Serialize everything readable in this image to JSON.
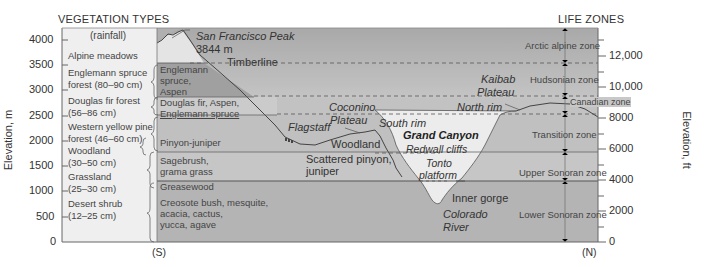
{
  "headers": {
    "left": "VEGETATION TYPES",
    "rainfall": "(rainfall)",
    "right": "LIFE ZONES"
  },
  "axes": {
    "left_label": "Elevation, m",
    "right_label": "Elevation, ft",
    "left_ticks": [
      "4000",
      "3500",
      "3000",
      "2500",
      "2000",
      "1500",
      "1000",
      "500",
      "0"
    ],
    "right_ticks": [
      "12,000",
      "10,000",
      "8000",
      "6000",
      "4000",
      "2000",
      "0"
    ],
    "south": "(S)",
    "north": "(N)"
  },
  "vegetation_types": [
    {
      "name": "Alpine meadows"
    },
    {
      "name": "Englemann spruce",
      "rain": "forest (80–90 cm)"
    },
    {
      "name": "Douglas fir forest",
      "rain": "(56–86 cm)"
    },
    {
      "name": "Western yellow pine",
      "rain": "forest (46–60 cm)"
    },
    {
      "name": "Woodland",
      "rain": "(30–50 cm)"
    },
    {
      "name": "Grassland",
      "rain": "(25–30 cm)"
    },
    {
      "name": "Desert shrub",
      "rain": "(12–25 cm)"
    }
  ],
  "band_labels": {
    "englemann": [
      "Englemann",
      "spruce,",
      "Aspen"
    ],
    "douglas": [
      "Douglas fir, Aspen,",
      "Englemann spruce"
    ],
    "pinyon": "Pinyon-juniper",
    "sagebrush": [
      "Sagebrush,",
      "grama grass"
    ],
    "greasewood": "Greasewood",
    "creosote": [
      "Creosote bush, mesquite,",
      "acacia, cactus,",
      "yucca, agave"
    ]
  },
  "landmarks": {
    "peak_name": "San Francisco Peak",
    "peak_elev": "3844 m",
    "timberline": "Timberline",
    "coconino": [
      "Coconino",
      "Plateau"
    ],
    "flagstaff": "Flagstaff",
    "south_rim": "South rim",
    "woodland": "Woodland",
    "scattered": [
      "Scattered pinyon,",
      "juniper"
    ],
    "grand_canyon": "Grand Canyon",
    "redwall": "Redwall cliffs",
    "tonto": [
      "Tonto",
      "platform"
    ],
    "inner_gorge": "Inner gorge",
    "colorado": [
      "Colorado",
      "River"
    ],
    "kaibab": [
      "Kaibab",
      "Plateau"
    ],
    "north_rim": "North rim"
  },
  "life_zones": [
    "Arctic alpine zone",
    "Hudsonian zone",
    "Canadian zone",
    "Transition zone",
    "Upper Sonoran zone",
    "Lower Sonoran zone"
  ],
  "colors": {
    "band_top": "#b9b9b9",
    "band_mid": "#c6c6c6",
    "band_low": "#acacac",
    "canyon_fill": "#ececec",
    "veg_column": "#efefef",
    "dark_band": "#9e9e9e"
  }
}
